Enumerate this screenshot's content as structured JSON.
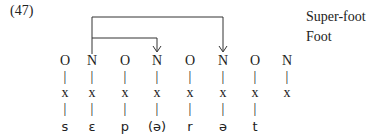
{
  "example_number": "(47)",
  "legend": {
    "super_foot": "Super-foot",
    "foot": "Foot"
  },
  "columns": [
    {
      "x": 65,
      "node": "O",
      "skeleton": "x",
      "segment": "s"
    },
    {
      "x": 92,
      "node": "N",
      "skeleton": "x",
      "segment": "ɛ"
    },
    {
      "x": 125,
      "node": "O",
      "skeleton": "x",
      "segment": "p"
    },
    {
      "x": 157,
      "node": "N",
      "skeleton": "x",
      "segment": "(ə)"
    },
    {
      "x": 190,
      "node": "O",
      "skeleton": "x",
      "segment": "r"
    },
    {
      "x": 223,
      "node": "N",
      "skeleton": "x",
      "segment": "ə"
    },
    {
      "x": 255,
      "node": "O",
      "skeleton": "x",
      "segment": "t"
    },
    {
      "x": 287,
      "node": "N",
      "skeleton": "x",
      "segment": ""
    }
  ],
  "arcs": [
    {
      "name": "super-foot",
      "from_col": 1,
      "to_col": 5,
      "y": 17
    },
    {
      "name": "foot",
      "from_col": 1,
      "to_col": 3,
      "y": 38
    }
  ],
  "colors": {
    "ink": "#222222",
    "background": "#ffffff"
  }
}
